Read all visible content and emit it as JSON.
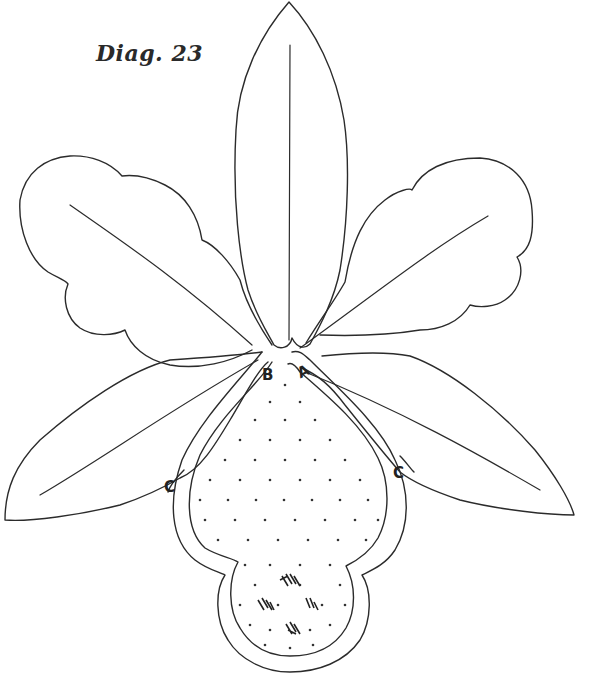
{
  "diagram": {
    "title": "Diag. 23",
    "labels": {
      "A": "A",
      "B": "B",
      "C_left": "C",
      "C_right": "C"
    },
    "parts": [
      "dorsal-sepal",
      "left-petal",
      "right-petal",
      "left-lateral-sepal",
      "right-lateral-sepal",
      "lip",
      "lip-inner-stippled-area"
    ],
    "colors": {
      "line": "#2b2b2b",
      "background": "#ffffff"
    }
  }
}
